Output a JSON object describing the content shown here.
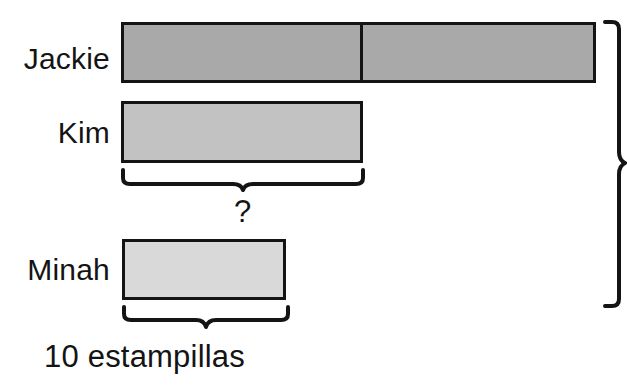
{
  "diagram": {
    "canvas": {
      "width": 627,
      "height": 386
    },
    "colors": {
      "stroke": "#141414",
      "background": "#ffffff",
      "jackie_fill": "#a9a9a9",
      "kim_fill": "#c2c2c2",
      "minah_fill": "#d9d9d9"
    },
    "rows": [
      {
        "key": "jackie",
        "label": "Jackie",
        "segments": 2,
        "bar": {
          "x": 121,
          "y": 22,
          "width": 475,
          "height": 61
        },
        "divider_x": 361,
        "fill": "#a9a9a9"
      },
      {
        "key": "kim",
        "label": "Kim",
        "segments": 1,
        "bar": {
          "x": 121,
          "y": 101,
          "width": 242,
          "height": 62
        },
        "fill": "#c2c2c2"
      },
      {
        "key": "minah",
        "label": "Minah",
        "segments": 1,
        "bar": {
          "x": 122,
          "y": 239,
          "width": 164,
          "height": 61
        },
        "fill": "#d9d9d9"
      }
    ],
    "annotations": {
      "unknown_marker": "?",
      "unit_caption": "10 estampillas",
      "unit_value": 10,
      "unit_name": "estampillas"
    },
    "braces": [
      {
        "key": "kim-brace",
        "orientation": "horizontal",
        "from": 121,
        "to": 363,
        "y": 170,
        "label": "?"
      },
      {
        "key": "minah-brace",
        "orientation": "horizontal",
        "from": 122,
        "to": 288,
        "y": 307,
        "label": "10 estampillas"
      },
      {
        "key": "total-brace",
        "orientation": "vertical",
        "from": 22,
        "to": 307,
        "x": 607,
        "label": ""
      }
    ]
  }
}
